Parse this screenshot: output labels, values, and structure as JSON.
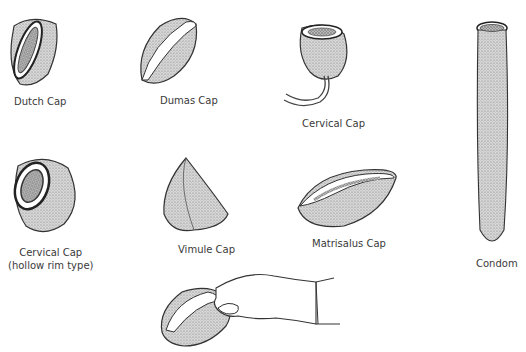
{
  "figure": {
    "items": [
      {
        "label": "Dutch Cap"
      },
      {
        "label": "Dumas Cap"
      },
      {
        "label": "Cervical Cap"
      },
      {
        "label": "Condom"
      },
      {
        "label": "Cervical Cap",
        "sublabel": "(hollow rim type)"
      },
      {
        "label": "Vimule Cap"
      },
      {
        "label": "Matrisalus Cap"
      }
    ],
    "insertion_illustration": "hand-holding-cap"
  }
}
